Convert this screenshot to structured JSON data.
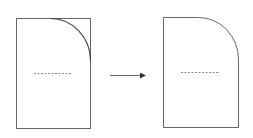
{
  "diagram": {
    "stroke_color": "#555555",
    "dash_color": "#888888",
    "before": {
      "label": "Rectangle with arc guide on top-right corner",
      "x": 16,
      "y": 18,
      "width": 74,
      "height": 110,
      "arc_radius": 40
    },
    "arrow": {
      "x1": 110,
      "x2": 146,
      "y": 75
    },
    "after": {
      "label": "Rectangle with rounded top-right corner",
      "x": 163,
      "y": 17,
      "width": 75,
      "height": 110,
      "corner_radius": 40
    }
  }
}
